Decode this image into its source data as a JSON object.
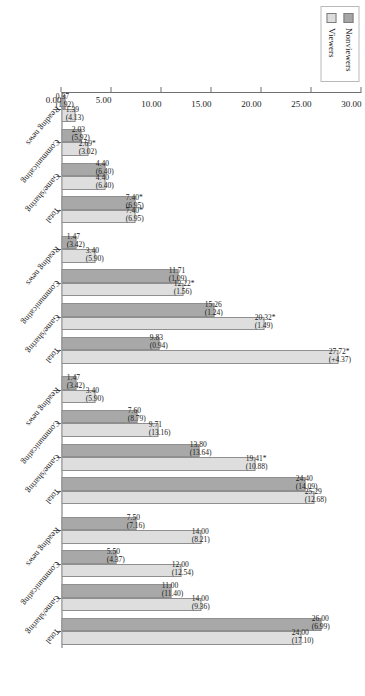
{
  "legend": {
    "position": "top-left",
    "items": [
      {
        "label": "Nonviewers",
        "color": "#a8a8a8"
      },
      {
        "label": "Viewers",
        "color": "#dedede"
      }
    ]
  },
  "axis": {
    "value_ticks": [
      "0.00",
      "5.00",
      "10.00",
      "15.00",
      "20.00",
      "25.00",
      "30.00"
    ],
    "value_min": 0,
    "value_max": 30
  },
  "chart_data": {
    "type": "bar",
    "orientation": "vertical-rotated",
    "title": "",
    "xlabel": "",
    "ylabel": "",
    "ylim": [
      0,
      30
    ],
    "grid": false,
    "legend_position": "top-left",
    "categories": [
      "Reading news",
      "Communicating",
      "Game/sharing",
      "Total",
      "Reading news",
      "Communicating",
      "Game/sharing",
      "Total",
      "Reading news",
      "Communicating",
      "Game/sharing",
      "Total",
      "Reading news",
      "Communicating",
      "Game/sharing",
      "Total"
    ],
    "series": [
      {
        "name": "Nonviewers",
        "color": "#a8a8a8",
        "values": [
          0.37,
          2.03,
          4.4,
          7.4,
          1.47,
          11.71,
          15.26,
          20.32,
          7.6,
          13.8,
          24.4,
          24.4,
          7.5,
          5.5,
          11.0,
          26.0
        ],
        "labels": [
          "0.37\n(1.92)",
          "2.03\n(5.92)",
          "4.40\n(6.40)",
          "7.40*\n(6.95)",
          "1.47\n(3.42)",
          "11.71\n(1.09)",
          "15.26\n(1.24)",
          "20.32*\n(1.49)",
          "7.60\n(8.79)",
          "13.80\n(13.64)",
          "24.40\n(14.09)",
          "24.40\n(14.09)",
          "7.50\n(7.16)",
          "5.50\n(4.37)",
          "11.00\n(11.40)",
          "26.00\n(6.99)"
        ]
      },
      {
        "name": "Viewers",
        "color": "#dedede",
        "values": [
          1.39,
          2.69,
          4.4,
          7.4,
          3.4,
          12.22,
          15.26,
          27.72,
          9.71,
          19.41,
          25.29,
          25.29,
          14.0,
          12.0,
          14.0,
          24.0
        ],
        "labels": [
          "1.39\n(4.13)",
          "2.69*\n(3.02)",
          "4.40\n(6.40)",
          "7.40*\n(6.95)",
          "3.40\n(5.90)",
          "12.22*\n(1.56)",
          "15.26\n(1.24)",
          "27.72*\n(+4.37)",
          "9.71\n(13.16)",
          "19.41*\n(10.88)",
          "25.29\n(12.68)",
          "25.29\n(12.68)",
          "14.00\n(8.21)",
          "12.00\n(12.54)",
          "14.00\n(9.36)",
          "24.00\n(17.10)"
        ]
      }
    ],
    "groups": [
      {
        "name": "Group 1",
        "bars": [
          {
            "category": "Reading news",
            "nonviewers": 0.37,
            "nonviewers_label": "0.37",
            "nonviewers_sd": "(1.92)",
            "viewers": 1.39,
            "viewers_label": "1.39",
            "viewers_sd": "(4.13)"
          },
          {
            "category": "Communicating",
            "nonviewers": 2.03,
            "nonviewers_label": "2.03",
            "nonviewers_sd": "(5.92)",
            "viewers": 2.69,
            "viewers_label": "2.69*",
            "viewers_sd": "(3.02)"
          },
          {
            "category": "Game/sharing",
            "nonviewers": 4.4,
            "nonviewers_label": "4.40",
            "nonviewers_sd": "(6.40)",
            "viewers": 4.4,
            "viewers_label": "4.40",
            "viewers_sd": "(6.40)"
          },
          {
            "category": "Total",
            "nonviewers": 7.4,
            "nonviewers_label": "7.40*",
            "nonviewers_sd": "(6.95)",
            "viewers": 7.4,
            "viewers_label": "7.40*",
            "viewers_sd": "(6.95)"
          }
        ]
      },
      {
        "name": "Group 2",
        "bars": [
          {
            "category": "Reading news",
            "nonviewers": 1.47,
            "nonviewers_label": "1.47",
            "nonviewers_sd": "(3.42)",
            "viewers": 3.4,
            "viewers_label": "3.40",
            "viewers_sd": "(5.90)"
          },
          {
            "category": "Communicating",
            "nonviewers": 11.71,
            "nonviewers_label": "11.71",
            "nonviewers_sd": "(1.09)",
            "viewers": 12.22,
            "viewers_label": "12.22*",
            "viewers_sd": "(1.56)"
          },
          {
            "category": "Game/sharing",
            "nonviewers": 15.26,
            "nonviewers_label": "15.26",
            "nonviewers_sd": "(1.24)",
            "viewers": 20.32,
            "viewers_label": "20.32*",
            "viewers_sd": "(1.49)"
          },
          {
            "category": "Total",
            "nonviewers": 9.83,
            "nonviewers_label": "9.83",
            "nonviewers_sd": "(0.94)",
            "viewers": 27.72,
            "viewers_label": "27.72*",
            "viewers_sd": "(+4.37)"
          }
        ]
      },
      {
        "name": "Group 3",
        "bars": [
          {
            "category": "Reading news",
            "nonviewers": 1.47,
            "nonviewers_label": "1.47",
            "nonviewers_sd": "(3.42)",
            "viewers": 3.4,
            "viewers_label": "3.40",
            "viewers_sd": "(5.90)"
          },
          {
            "category": "Communicating",
            "nonviewers": 7.6,
            "nonviewers_label": "7.60",
            "nonviewers_sd": "(8.79)",
            "viewers": 9.71,
            "viewers_label": "9.71",
            "viewers_sd": "(13.16)"
          },
          {
            "category": "Game/sharing",
            "nonviewers": 13.8,
            "nonviewers_label": "13.80",
            "nonviewers_sd": "(13.64)",
            "viewers": 19.41,
            "viewers_label": "19.41*",
            "viewers_sd": "(10.88)"
          },
          {
            "category": "Total",
            "nonviewers": 24.4,
            "nonviewers_label": "24.40",
            "nonviewers_sd": "(14.09)",
            "viewers": 25.29,
            "viewers_label": "25.29",
            "viewers_sd": "(12.68)"
          }
        ]
      },
      {
        "name": "Group 4",
        "bars": [
          {
            "category": "Reading news",
            "nonviewers": 7.5,
            "nonviewers_label": "7.50",
            "nonviewers_sd": "(7.16)",
            "viewers": 14.0,
            "viewers_label": "14.00",
            "viewers_sd": "(8.21)"
          },
          {
            "category": "Communicating",
            "nonviewers": 5.5,
            "nonviewers_label": "5.50",
            "nonviewers_sd": "(4.37)",
            "viewers": 12.0,
            "viewers_label": "12.00",
            "viewers_sd": "(12.54)"
          },
          {
            "category": "Game/sharing",
            "nonviewers": 11.0,
            "nonviewers_label": "11.00",
            "nonviewers_sd": "(11.40)",
            "viewers": 14.0,
            "viewers_label": "14.00",
            "viewers_sd": "(9.36)"
          },
          {
            "category": "Total",
            "nonviewers": 26.0,
            "nonviewers_label": "26.00",
            "nonviewers_sd": "(6.99)",
            "viewers": 24.0,
            "viewers_label": "24.00",
            "viewers_sd": "(17.10)"
          }
        ]
      }
    ]
  }
}
